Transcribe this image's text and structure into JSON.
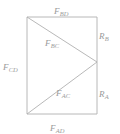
{
  "figure": {
    "background_color": "#ffffff",
    "line_color": "#b0b0b0",
    "label_color": "#9a9a9a"
  },
  "geometry": {
    "rectangle": {
      "left": 27,
      "top": 17,
      "right": 97,
      "bottom": 114
    },
    "apex": {
      "x": 97,
      "y": 62
    },
    "members": [
      {
        "name": "top-chord",
        "from": [
          27,
          17
        ],
        "to": [
          97,
          17
        ]
      },
      {
        "name": "left-chord",
        "from": [
          27,
          17
        ],
        "to": [
          27,
          114
        ]
      },
      {
        "name": "bottom-chord",
        "from": [
          27,
          114
        ],
        "to": [
          97,
          114
        ]
      },
      {
        "name": "right-upper-chord",
        "from": [
          97,
          17
        ],
        "to": [
          97,
          62
        ]
      },
      {
        "name": "right-lower-chord",
        "from": [
          97,
          62
        ],
        "to": [
          97,
          114
        ]
      },
      {
        "name": "upper-diagonal",
        "from": [
          27,
          17
        ],
        "to": [
          97,
          62
        ]
      },
      {
        "name": "lower-diagonal",
        "from": [
          27,
          114
        ],
        "to": [
          97,
          62
        ]
      }
    ]
  },
  "labels": {
    "top": {
      "base": "F",
      "sub": "BD"
    },
    "left": {
      "base": "F",
      "sub": "CD"
    },
    "right_upper": {
      "base": "R",
      "sub": "B"
    },
    "right_lower": {
      "base": "R",
      "sub": "A"
    },
    "bottom": {
      "base": "F",
      "sub": "AD"
    },
    "diagonal_upper": {
      "base": "F",
      "sub": "BC"
    },
    "diagonal_lower": {
      "base": "F",
      "sub": "AC"
    }
  }
}
